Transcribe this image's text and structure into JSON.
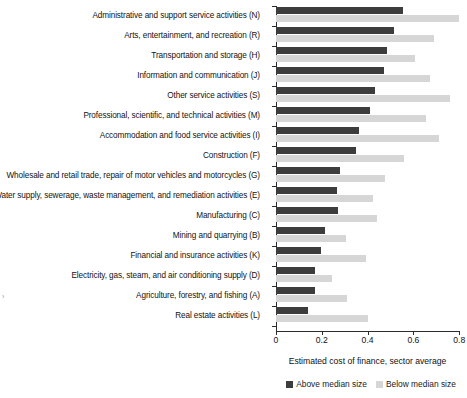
{
  "chart_data": {
    "type": "bar",
    "orientation": "horizontal",
    "title": "",
    "xlabel": "Estimated cost of finance, sector average",
    "ylabel": "",
    "xlim": [
      0,
      0.8
    ],
    "xticks": [
      0,
      0.2,
      0.4,
      0.6,
      0.8
    ],
    "xticklabels": [
      "0",
      "0.2",
      "0.4",
      "0.6",
      "0.8"
    ],
    "grid": false,
    "legend_position": "bottom",
    "colors": {
      "above_median": "#3d3d3d",
      "below_median": "#d6d6d6"
    },
    "categories": [
      "Administrative and support service activities (N)",
      "Arts, entertainment, and recreation (R)",
      "Transportation and storage (H)",
      "Information and communication (J)",
      "Other service activities (S)",
      "Professional, scientific, and technical activities (M)",
      "Accommodation and food service activities (I)",
      "Construction (F)",
      "Wholesale and retail trade, repair of motor vehicles and motorcycles (G)",
      "Water supply, sewerage, waste management, and remediation activities (E)",
      "Manufacturing (C)",
      "Mining and quarrying (B)",
      "Financial and insurance activities (K)",
      "Electricity, gas, steam, and air conditioning supply (D)",
      "Agriculture, forestry, and fishing (A)",
      "Real estate activities (L)"
    ],
    "series": [
      {
        "name": "Above median size",
        "color": "#3d3d3d",
        "values": [
          0.555,
          0.515,
          0.485,
          0.47,
          0.43,
          0.41,
          0.363,
          0.35,
          0.28,
          0.266,
          0.27,
          0.215,
          0.197,
          0.17,
          0.17,
          0.14
        ]
      },
      {
        "name": "Below median size",
        "color": "#d6d6d6",
        "values": [
          0.8,
          0.69,
          0.607,
          0.672,
          0.76,
          0.655,
          0.712,
          0.56,
          0.475,
          0.423,
          0.44,
          0.305,
          0.393,
          0.245,
          0.31,
          0.4
        ]
      }
    ],
    "legend": [
      {
        "label": "Above median size",
        "color": "#3d3d3d"
      },
      {
        "label": "Below median size",
        "color": "#d6d6d6"
      }
    ]
  }
}
